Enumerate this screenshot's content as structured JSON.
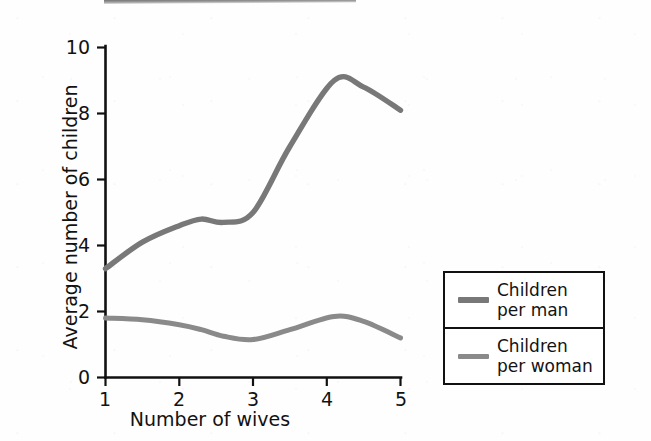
{
  "chart_data": {
    "type": "line",
    "title": "",
    "subtitle": "",
    "xlabel": "Number of wives",
    "ylabel": "Average number of children",
    "xlim": [
      1,
      5
    ],
    "ylim": [
      0,
      10
    ],
    "x_ticks": [
      "1",
      "2",
      "3",
      "4",
      "5"
    ],
    "y_ticks": [
      "0",
      "2",
      "4",
      "6",
      "8",
      "10"
    ],
    "grid": false,
    "legend_position": "right-outside",
    "x": [
      1,
      1.5,
      2,
      2.3,
      2.6,
      3,
      3.5,
      4.1,
      4.5,
      5
    ],
    "series": [
      {
        "name": "Children per man",
        "color": "#787878",
        "values": [
          3.3,
          4.1,
          4.6,
          4.8,
          4.7,
          5.0,
          7.0,
          9.0,
          8.8,
          8.1
        ]
      },
      {
        "name": "Children per woman",
        "color": "#8a8a8a",
        "values": [
          1.8,
          1.75,
          1.6,
          1.45,
          1.25,
          1.15,
          1.45,
          1.85,
          1.7,
          1.2
        ]
      }
    ],
    "annotations": []
  },
  "axes": {
    "x_title": "Number of wives",
    "y_title": "Average number of children",
    "x_tick_labels": [
      "1",
      "2",
      "3",
      "4",
      "5"
    ],
    "y_tick_labels": [
      "0",
      "2",
      "4",
      "6",
      "8",
      "10"
    ],
    "axis_color": "#111111"
  },
  "legend": {
    "entries": [
      {
        "line1": "Children",
        "line2": "per man",
        "color": "#787878"
      },
      {
        "line1": "Children",
        "line2": "per woman",
        "color": "#8a8a8a"
      }
    ]
  },
  "colors": {
    "men_line": "#787878",
    "women_line": "#8a8a8a",
    "axis": "#111111",
    "text": "#121212",
    "background": "#ffffff"
  }
}
